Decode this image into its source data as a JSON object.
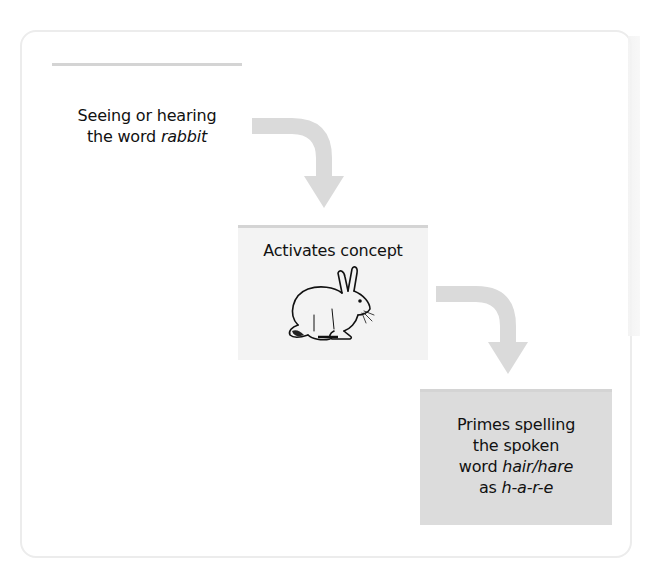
{
  "diagram": {
    "steps": [
      {
        "line1": "Seeing or hearing",
        "line2_prefix": "the word ",
        "line2_italic": "rabbit"
      },
      {
        "title": "Activates concept",
        "image": "rabbit-illustration"
      },
      {
        "line1": "Primes spelling",
        "line2": "the spoken",
        "line3_prefix": "word ",
        "line3_italic": "hair/hare",
        "line4_prefix": "as ",
        "line4_italic": "h-a-r-e"
      }
    ],
    "arrows": [
      {
        "from": 0,
        "to": 1,
        "icon": "curved-arrow-down-icon"
      },
      {
        "from": 1,
        "to": 2,
        "icon": "curved-arrow-down-icon"
      }
    ],
    "colors": {
      "arrow": "#dadada",
      "box2_bg": "#f3f3f3",
      "box3_bg": "#dcdcdc",
      "rule": "#d4d4d4",
      "frame_border": "#ececec"
    }
  }
}
